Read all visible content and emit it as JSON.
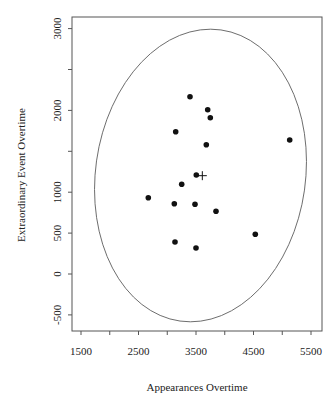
{
  "chart_data": {
    "type": "scatter",
    "title": "",
    "xlabel": "Appearances Overtime",
    "ylabel": "Extraordinary Event Overtime",
    "xlim": [
      1200,
      5700
    ],
    "ylim": [
      -650,
      3150
    ],
    "x_ticks": [
      1500,
      2000,
      2500,
      3000,
      3500,
      4000,
      4500,
      5000,
      5500
    ],
    "x_tick_labels": [
      "1500",
      "",
      "2500",
      "",
      "3500",
      "",
      "4500",
      "",
      "5500"
    ],
    "y_ticks": [
      -500,
      0,
      500,
      1000,
      1500,
      2000,
      2500,
      3000
    ],
    "y_tick_labels": [
      "-500",
      "0",
      "500",
      "1000",
      "",
      "2000",
      "",
      "3000"
    ],
    "grid": false,
    "legend": null,
    "series": [
      {
        "name": "observations",
        "marker": "filled-circle",
        "x": [
          3396,
          3703,
          3749,
          3147,
          3679,
          3505,
          3251,
          2670,
          3123,
          3483,
          3848,
          3135,
          3500,
          5130,
          4531
        ],
        "y": [
          2167,
          2009,
          1911,
          1740,
          1581,
          1210,
          1097,
          933,
          859,
          852,
          766,
          391,
          318,
          1638,
          485
        ]
      }
    ],
    "annotations": [
      {
        "type": "mean-marker",
        "symbol": "+",
        "x": 3610,
        "y": 1202
      },
      {
        "type": "confidence-ellipse",
        "center_x": 3570,
        "center_y": 1200,
        "note": "elliptical contour around data, slightly tilted"
      }
    ]
  },
  "axes": {
    "x_title": "Appearances Overtime",
    "y_title": "Extraordinary Event Overtime"
  }
}
